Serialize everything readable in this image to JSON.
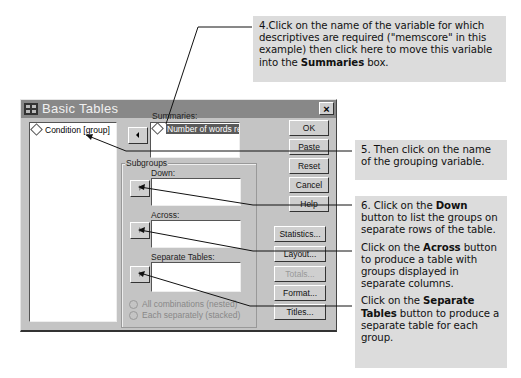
{
  "annotations": {
    "step4": {
      "pre": "4.Click on the name of the variable for which descriptives are required (\"memscore\" in this example) then click here to move this variable into the ",
      "bold": "Summaries",
      "post": " box."
    },
    "step5": {
      "text": "5. Then click on the name of the grouping variable."
    },
    "step6": {
      "pre": "6. Click on the ",
      "bold": "Down",
      "post": " button to list the groups on separate rows of the table."
    },
    "across": {
      "pre": "Click on the ",
      "bold": "Across",
      "post": " button to produce a table with groups displayed in separate columns."
    },
    "separate": {
      "pre": "Click on the ",
      "bold": "Separate Tables",
      "post": " button to produce a separate table for each group."
    }
  },
  "dialog": {
    "title": "Basic Tables",
    "close": "×",
    "variables": [
      "Condition [group]"
    ],
    "summaries_label": "Summaries:",
    "summaries_items": [
      "Number of words recal"
    ],
    "subgroups_label": "Subgroups",
    "down_label": "Down:",
    "across_label": "Across:",
    "separate_label": "Separate Tables:",
    "radio_all": "All combinations (nested)",
    "radio_each": "Each separately (stacked)",
    "buttons": {
      "ok": "OK",
      "paste": "Paste",
      "reset": "Reset",
      "cancel": "Cancel",
      "help": "Help",
      "statistics": "Statistics...",
      "layout": "Layout...",
      "totals": "Totals...",
      "format": "Format...",
      "titles": "Titles..."
    }
  }
}
